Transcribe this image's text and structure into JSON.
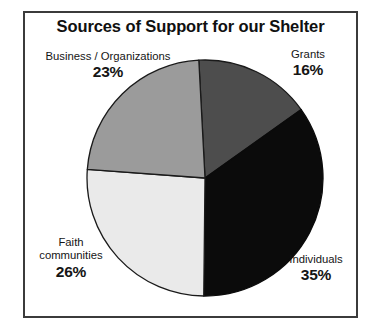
{
  "chart_data": {
    "type": "pie",
    "title": "Sources of Support for our Shelter",
    "subtitle": "",
    "xlabel": "",
    "ylabel": "",
    "legend_position": "none",
    "grid": false,
    "value_unit": "%",
    "total": 100,
    "categories": [
      "Grants",
      "Individuals",
      "Faith communities",
      "Business / Organizations"
    ],
    "values": [
      16,
      35,
      26,
      23
    ],
    "start_angle_deg": -3,
    "direction": "clockwise",
    "slices": [
      {
        "label": "Grants",
        "label_display": "Grants",
        "value": 16,
        "value_label": "16%",
        "color": "#4d4d4d",
        "stroke": "#1a1a1a",
        "start_deg": -3,
        "end_deg": 54.6
      },
      {
        "label": "Individuals",
        "label_display": "Individuals",
        "value": 35,
        "value_label": "35%",
        "color": "#0b0b0b",
        "stroke": "#0b0b0b",
        "start_deg": 54.6,
        "end_deg": 180.6
      },
      {
        "label": "Faith communities",
        "label_display": "Faith\ncommunities",
        "value": 26,
        "value_label": "26%",
        "color": "#eaeaea",
        "stroke": "#1a1a1a",
        "start_deg": 180.6,
        "end_deg": 274.2
      },
      {
        "label": "Business / Organizations",
        "label_display": "Business / Organizations",
        "value": 23,
        "value_label": "23%",
        "color": "#9b9b9b",
        "stroke": "#1a1a1a",
        "start_deg": 274.2,
        "end_deg": 357
      }
    ],
    "colors": {
      "grants": "#4d4d4d",
      "individuals": "#0b0b0b",
      "faith_communities": "#eaeaea",
      "business_organizations": "#9b9b9b",
      "frame": "#3b3b3b",
      "text": "#151515",
      "background": "#ffffff"
    }
  },
  "frame": {
    "border_color": "#3b3b3b"
  }
}
